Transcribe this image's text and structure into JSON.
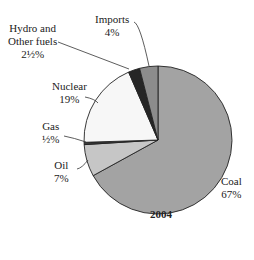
{
  "chart_data": {
    "type": "pie",
    "title": "2004",
    "start_angle_deg": 0,
    "direction": "clockwise",
    "slices": [
      {
        "name": "Coal",
        "value": 67,
        "label": "67%",
        "color": "#a3a3a3"
      },
      {
        "name": "Oil",
        "value": 7,
        "label": "7%",
        "color": "#c6c6c6"
      },
      {
        "name": "Gas",
        "value": 0.5,
        "label": "½%",
        "color": "#3a3a3a"
      },
      {
        "name": "Nuclear",
        "value": 19,
        "label": "19%",
        "color": "#f7f7f7"
      },
      {
        "name": "Hydro and Other fuels",
        "value": 2.5,
        "label": "2½%",
        "color": "#262626"
      },
      {
        "name": "Imports",
        "value": 4,
        "label": "4%",
        "color": "#8c8c8c"
      }
    ]
  },
  "labels": {
    "imports": {
      "line1": "Imports",
      "line2": "4%"
    },
    "hydro": {
      "line1": "Hydro and",
      "line2": "Other fuels",
      "line3": "2½%"
    },
    "nuclear": {
      "line1": "Nuclear",
      "line2": "19%"
    },
    "gas": {
      "line1": "Gas",
      "line2": "½%"
    },
    "oil": {
      "line1": "Oil",
      "line2": "7%"
    },
    "coal": {
      "line1": "Coal",
      "line2": "67%"
    }
  },
  "title": "2004"
}
